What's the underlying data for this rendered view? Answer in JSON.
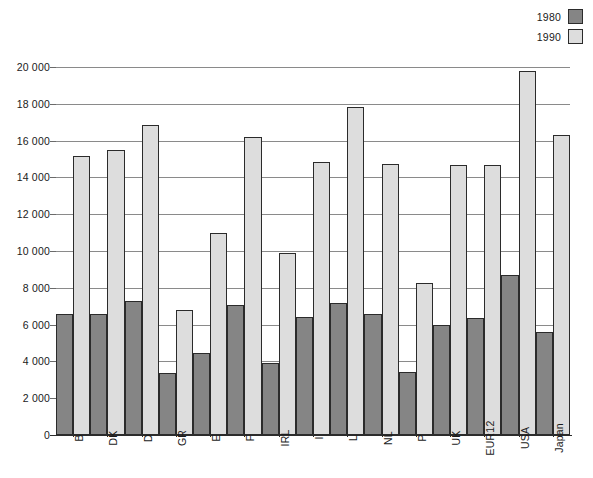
{
  "chart_data": {
    "type": "bar",
    "title": "",
    "xlabel": "",
    "ylabel": "",
    "ylim": [
      0,
      20000
    ],
    "yticks": [
      0,
      2000,
      4000,
      6000,
      8000,
      10000,
      12000,
      14000,
      16000,
      18000,
      20000
    ],
    "ytick_labels": [
      "0",
      "2 000",
      "4 000",
      "6 000",
      "8 000",
      "10 000",
      "12 000",
      "14 000",
      "16 000",
      "18 000",
      "20 000"
    ],
    "grid": true,
    "legend_position": "top-right",
    "categories": [
      "B",
      "DK",
      "D",
      "GR",
      "E",
      "F",
      "IRL",
      "I",
      "L",
      "NL",
      "P",
      "UK",
      "EUR12",
      "USA",
      "Japan"
    ],
    "series": [
      {
        "name": "1980",
        "color": "#858585",
        "values": [
          6600,
          6550,
          7300,
          3350,
          4450,
          7050,
          3900,
          6400,
          7150,
          6600,
          3450,
          6000,
          6350,
          8700,
          5600
        ]
      },
      {
        "name": "1990",
        "color": "#dddddd",
        "values": [
          15150,
          15500,
          16850,
          6800,
          11000,
          16200,
          9900,
          14850,
          17850,
          14750,
          8250,
          14650,
          14650,
          19800,
          16300
        ]
      }
    ]
  },
  "legend": {
    "entries": [
      {
        "label": "1980",
        "swatch": "dark-gray"
      },
      {
        "label": "1990",
        "swatch": "light-gray"
      }
    ]
  },
  "caption": {
    "text": ""
  }
}
